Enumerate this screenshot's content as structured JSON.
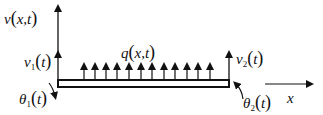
{
  "diagram": {
    "type": "beam-element-loading",
    "colors": {
      "stroke": "#111111",
      "background": "#ffffff"
    },
    "labels": {
      "v_axis": {
        "sym": "v",
        "args": "x,t"
      },
      "q_load": {
        "sym": "q",
        "args": "x,t"
      },
      "v1": {
        "sym": "v",
        "sub": "1",
        "args": "t"
      },
      "v2": {
        "sym": "v",
        "sub": "2",
        "args": "t"
      },
      "theta1": {
        "sym": "θ",
        "sub": "1",
        "args": "t"
      },
      "theta2": {
        "sym": "θ",
        "sub": "2",
        "args": "t"
      },
      "x_axis": {
        "sym": "x"
      }
    },
    "distributed_load_arrow_count": 12
  }
}
